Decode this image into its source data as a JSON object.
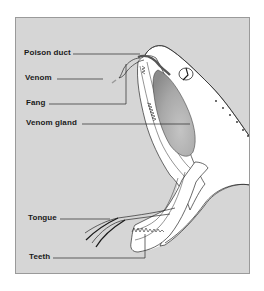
{
  "figure": {
    "labels": {
      "poison_duct": "Poison duct",
      "venom": "Venom",
      "fang": "Fang",
      "venom_gland": "Venom gland",
      "tongue": "Tongue",
      "teeth": "Teeth"
    },
    "colors": {
      "panel_background": "#d6d6d6",
      "panel_border": "#9a9a9a",
      "head_fill": "#ffffff",
      "outline": "#2a2a2a",
      "gland_fill": "#a8a8a8",
      "duct_color": "#555555"
    }
  }
}
